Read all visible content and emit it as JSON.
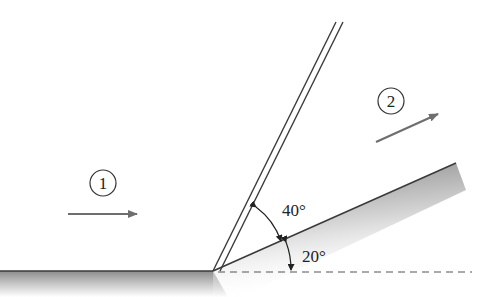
{
  "diagram": {
    "regions": [
      {
        "id": "1",
        "label": "1"
      },
      {
        "id": "2",
        "label": "2"
      }
    ],
    "angles": {
      "wave_angle": "40°",
      "wedge_angle": "20°"
    },
    "colors": {
      "line": "#3a3a3a",
      "arrow": "#6e6e6e",
      "shade": "#9a9a9a"
    }
  }
}
